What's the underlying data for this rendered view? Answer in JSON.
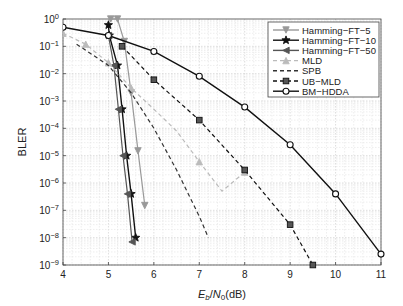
{
  "chart_data": {
    "type": "line",
    "title": "",
    "xlabel": "E_b/N_0(dB)",
    "xlabel_parts": {
      "e": "E",
      "b": "b",
      "slash": "/",
      "n": "N",
      "zero": "0",
      "unit": "(dB)"
    },
    "ylabel": "BLER",
    "xlim": [
      4,
      11
    ],
    "ylim": [
      1e-09,
      1
    ],
    "yscale": "log",
    "grid": true,
    "legend_position": "upper right",
    "x_ticks": [
      "4",
      "5",
      "6",
      "7",
      "8",
      "9",
      "10",
      "11"
    ],
    "y_ticks": [
      "10^0",
      "10^-1",
      "10^-2",
      "10^-3",
      "10^-4",
      "10^-5",
      "10^-6",
      "10^-7",
      "10^-8",
      "10^-9"
    ],
    "y_tick_exponents": [
      "0",
      "−1",
      "−2",
      "−3",
      "−4",
      "−5",
      "−6",
      "−7",
      "−8",
      "−9"
    ],
    "series": [
      {
        "name": "Hamming-FT-5",
        "label": "Hamming−FT−5",
        "color": "#999999",
        "dash": "solid",
        "marker": "triangle-down",
        "x": [
          5.05,
          5.2,
          5.35,
          5.5,
          5.65,
          5.8
        ],
        "y": [
          1.0,
          1.0,
          0.15,
          0.002,
          1.5e-05,
          1.5e-07
        ]
      },
      {
        "name": "Hamming-FT-10",
        "label": "Hamming−FT−10",
        "color": "#111111",
        "dash": "solid",
        "marker": "star",
        "x": [
          5.0,
          5.02,
          5.2,
          5.3,
          5.4,
          5.5,
          5.6
        ],
        "y": [
          0.6,
          0.25,
          0.02,
          0.0005,
          1e-05,
          4e-07,
          1e-08
        ]
      },
      {
        "name": "Hamming-FT-50",
        "label": "Hamming−FT−50",
        "color": "#555555",
        "dash": "solid",
        "marker": "triangle-left",
        "x": [
          5.0,
          5.12,
          5.22,
          5.32,
          5.42,
          5.52
        ],
        "y": [
          0.25,
          0.02,
          0.0005,
          1e-05,
          4e-07,
          7e-09
        ]
      },
      {
        "name": "MLD",
        "label": "MLD",
        "color": "#bbbbbb",
        "dash": "dashed",
        "marker": "triangle-up",
        "x": [
          4.0,
          4.5,
          5.0,
          5.5,
          6.0,
          6.5,
          7.0,
          7.5,
          8.0
        ],
        "y": [
          0.3,
          0.12,
          0.025,
          0.003,
          0.0005,
          8e-05,
          6e-06,
          5e-07,
          2.5e-06
        ]
      },
      {
        "name": "SPB",
        "label": "SPB",
        "color": "#333333",
        "dash": "dashed",
        "marker": "none",
        "x": [
          4.3,
          5.0,
          5.5,
          6.0,
          6.5,
          7.0,
          7.2
        ],
        "y": [
          0.12,
          0.02,
          0.002,
          0.0001,
          3e-06,
          6e-08,
          1e-08
        ]
      },
      {
        "name": "UB-MLD",
        "label": "UB−MLD",
        "color": "#111111",
        "dash": "dashed",
        "marker": "square",
        "x": [
          5.3,
          6.0,
          7.0,
          8.0,
          9.0,
          9.5
        ],
        "y": [
          0.1,
          0.006,
          0.0002,
          3e-06,
          3e-08,
          1e-09
        ]
      },
      {
        "name": "BM-HDDA",
        "label": "BM−HDDA",
        "color": "#111111",
        "dash": "solid",
        "marker": "circle",
        "x": [
          4,
          5,
          6,
          7,
          8,
          9,
          10,
          11
        ],
        "y": [
          0.5,
          0.25,
          0.065,
          0.008,
          0.0006,
          2.5e-05,
          4e-07,
          2.5e-09
        ]
      }
    ]
  }
}
